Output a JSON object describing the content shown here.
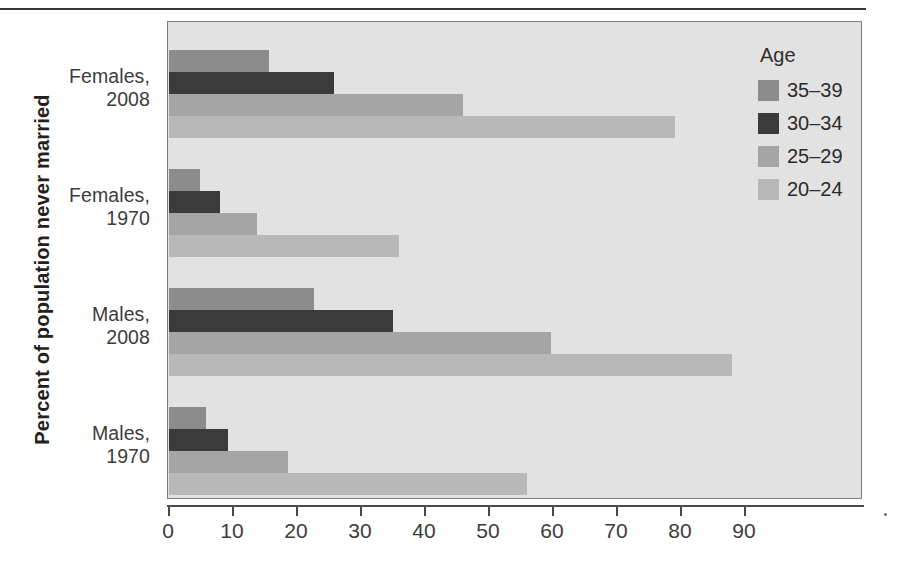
{
  "chart_data": {
    "type": "bar",
    "orientation": "horizontal",
    "title": "",
    "xlabel": "",
    "ylabel": "Percent of population never married",
    "categories": [
      "Females, 2008",
      "Females, 1970",
      "Males, 2008",
      "Males, 1970"
    ],
    "series": [
      {
        "name": "35–39",
        "color": "#8c8c8c",
        "values": [
          15.6,
          4.9,
          22.7,
          5.8
        ]
      },
      {
        "name": "30–34",
        "color": "#3b3b3b",
        "values": [
          25.8,
          8.0,
          35.0,
          9.2
        ]
      },
      {
        "name": "25–29",
        "color": "#a5a5a5",
        "values": [
          46.0,
          13.8,
          59.7,
          18.6
        ]
      },
      {
        "name": "20–24",
        "color": "#b8b8b8",
        "values": [
          79.0,
          36.0,
          88.0,
          56.0
        ]
      }
    ],
    "xlim": [
      0,
      95
    ],
    "xticks": [
      0,
      10,
      20,
      30,
      40,
      50,
      60,
      70,
      80,
      90
    ],
    "xticklabels": [
      "0",
      "10",
      "20",
      "30",
      "40",
      "50",
      "60",
      "70",
      "80",
      "90"
    ],
    "grid": false,
    "legend": {
      "title": "Age",
      "position": "inside-top-right",
      "entries": [
        "35–39",
        "30–34",
        "25–29",
        "20–24"
      ]
    },
    "plot_background": "#e2e2e2"
  },
  "axis": {
    "y_title": "Percent of population never married",
    "group_labels": [
      {
        "line1": "Females,",
        "line2": "2008"
      },
      {
        "line1": "Females,",
        "line2": "1970"
      },
      {
        "line1": "Males,",
        "line2": "2008"
      },
      {
        "line1": "Males,",
        "line2": "1970"
      }
    ]
  }
}
